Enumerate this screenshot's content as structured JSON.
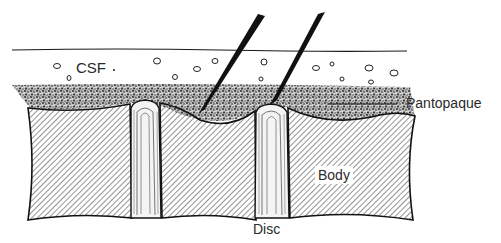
{
  "figure": {
    "type": "anatomical line drawing"
  },
  "labels": {
    "csf": "CSF",
    "pantopaque": "Pantopaque",
    "body": "Body",
    "disc": "Disc"
  },
  "colors": {
    "ink": "#1a1a1a",
    "stipple": "#555555",
    "background": "#ffffff"
  },
  "elements": {
    "needle_count": 2,
    "vertebral_body_count": 3,
    "disc_count": 2
  }
}
